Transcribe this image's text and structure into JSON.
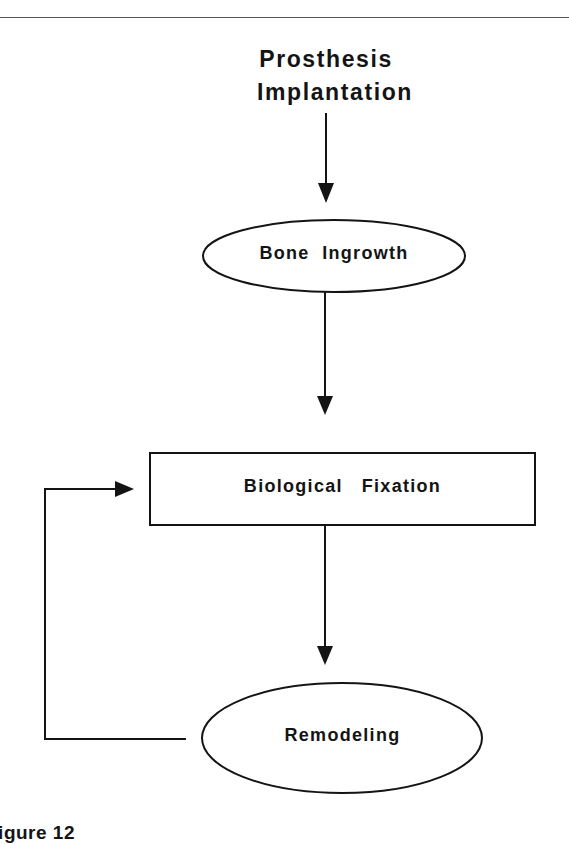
{
  "diagram": {
    "title": {
      "line1": "Prosthesis",
      "line2": "Implantation"
    },
    "nodes": [
      {
        "id": "bone-ingrowth",
        "shape": "ellipse",
        "label": "Bone  Ingrowth"
      },
      {
        "id": "biological-fixation",
        "shape": "rectangle",
        "label": "Biological   Fixation"
      },
      {
        "id": "remodeling",
        "shape": "ellipse",
        "label": "Remodeling"
      }
    ],
    "edges": [
      {
        "from": "Prosthesis Implantation",
        "to": "Bone Ingrowth"
      },
      {
        "from": "Bone Ingrowth",
        "to": "Biological Fixation"
      },
      {
        "from": "Biological Fixation",
        "to": "Remodeling"
      },
      {
        "from": "Remodeling",
        "to": "Biological Fixation",
        "type": "feedback-loop"
      }
    ],
    "caption": "Figure 12"
  },
  "colors": {
    "stroke": "#141414",
    "background": "#ffffff",
    "rule": "#555555"
  }
}
